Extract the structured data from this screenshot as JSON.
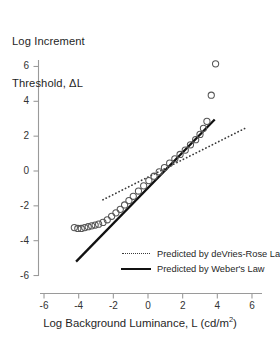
{
  "chart_data": {
    "type": "scatter",
    "title": "",
    "ylabel_line1": "Log Increment",
    "ylabel_line2": "Threshold, ΔL",
    "xlabel_prefix": "Log Background Luminance, L (cd/m",
    "xlabel_sup": "2",
    "xlabel_suffix": ")",
    "xlim": [
      -6,
      6
    ],
    "ylim": [
      -6,
      6
    ],
    "xticks": [
      -6,
      -4,
      -2,
      0,
      2,
      4,
      6
    ],
    "yticks": [
      -6,
      -4,
      -2,
      0,
      2,
      4,
      6
    ],
    "xtick_labels": [
      "-6",
      "-4",
      "-2",
      "0",
      "2",
      "4",
      "6"
    ],
    "ytick_labels": [
      "-6",
      "-4",
      "-2",
      "0",
      "2",
      "4",
      "6"
    ],
    "grid": false,
    "legend_position": "lower-right",
    "marker": "open-circle",
    "marker_color": "#555555",
    "series": [
      {
        "name": "Measured increment thresholds",
        "type": "scatter",
        "x": [
          -4.25,
          -4.05,
          -3.85,
          -3.65,
          -3.45,
          -3.25,
          -3.05,
          -2.85,
          -2.6,
          -2.35,
          -2.1,
          -1.85,
          -1.6,
          -1.35,
          -1.1,
          -0.85,
          -0.55,
          -0.25,
          0.05,
          0.35,
          0.65,
          0.95,
          1.25,
          1.55,
          1.85,
          2.15,
          2.45,
          2.75,
          3.0,
          3.2,
          3.4,
          3.65,
          3.9
        ],
        "y": [
          -3.25,
          -3.3,
          -3.3,
          -3.25,
          -3.2,
          -3.15,
          -3.1,
          -3.05,
          -2.95,
          -2.8,
          -2.6,
          -2.4,
          -2.2,
          -1.95,
          -1.7,
          -1.45,
          -1.15,
          -0.85,
          -0.55,
          -0.3,
          -0.05,
          0.2,
          0.45,
          0.7,
          0.95,
          1.2,
          1.5,
          1.8,
          2.1,
          2.45,
          2.85,
          4.35,
          6.15
        ]
      },
      {
        "name": "Predicted by deVries-Rose Law",
        "type": "line",
        "style": "dotted",
        "color": "#3a3a3a",
        "slope": 0.5,
        "intercept": -0.35,
        "x_range": [
          -2.6,
          5.6
        ]
      },
      {
        "name": "Predicted by Weber's Law",
        "type": "line",
        "style": "solid",
        "color": "#111111",
        "slope": 1.02,
        "intercept": -0.97,
        "x_range": [
          -4.15,
          3.85
        ]
      }
    ],
    "legend": [
      {
        "key": "dotted",
        "label": "Predicted by  deVries-Rose Law"
      },
      {
        "key": "solid",
        "label": "Predicted by Weber's Law"
      }
    ]
  }
}
